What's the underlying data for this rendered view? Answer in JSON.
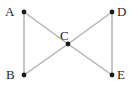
{
  "figure": {
    "width": 135,
    "height": 91,
    "background_color": "#ffffff",
    "edge_color": "#b3b3b3",
    "vertex_color": "#1a1a1a",
    "label_color": "#1f1f1f"
  },
  "chart_data": {
    "type": "diagram",
    "subtype": "node-link-graph",
    "title": "",
    "grid": false,
    "legend": null,
    "xlim": [
      0,
      135
    ],
    "ylim": [
      0,
      91
    ],
    "nodes": [
      {
        "id": "A",
        "label": "A",
        "x": 24,
        "y": 12,
        "label_x": 5,
        "label_y": 5,
        "label_position": "left"
      },
      {
        "id": "B",
        "label": "B",
        "x": 24,
        "y": 75,
        "label_x": 6,
        "label_y": 68,
        "label_position": "left"
      },
      {
        "id": "C",
        "label": "C",
        "x": 68,
        "y": 44,
        "label_x": 60,
        "label_y": 29,
        "label_position": "above"
      },
      {
        "id": "D",
        "label": "D",
        "x": 112,
        "y": 12,
        "label_x": 117,
        "label_y": 5,
        "label_position": "right"
      },
      {
        "id": "E",
        "label": "E",
        "x": 112,
        "y": 75,
        "label_x": 117,
        "label_y": 68,
        "label_position": "right"
      }
    ],
    "edges": [
      {
        "id": "A-B",
        "source": "A",
        "target": "B",
        "x1": 24,
        "y1": 12,
        "x2": 24,
        "y2": 75
      },
      {
        "id": "A-C",
        "source": "A",
        "target": "C",
        "x1": 24,
        "y1": 12,
        "x2": 68,
        "y2": 44
      },
      {
        "id": "B-C",
        "source": "B",
        "target": "C",
        "x1": 24,
        "y1": 75,
        "x2": 68,
        "y2": 44
      },
      {
        "id": "C-D",
        "source": "C",
        "target": "D",
        "x1": 68,
        "y1": 44,
        "x2": 112,
        "y2": 12
      },
      {
        "id": "C-E",
        "source": "C",
        "target": "E",
        "x1": 68,
        "y1": 44,
        "x2": 112,
        "y2": 75
      },
      {
        "id": "D-E",
        "source": "D",
        "target": "E",
        "x1": 112,
        "y1": 12,
        "x2": 112,
        "y2": 75
      }
    ],
    "node_radius": 2.4
  }
}
